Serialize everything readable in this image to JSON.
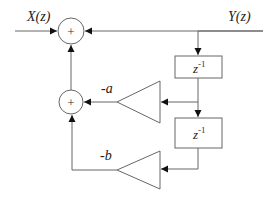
{
  "diagram": {
    "type": "block-diagram",
    "labels": {
      "input": "X(z)",
      "output": "Y(z)",
      "gain_a": "-a",
      "gain_b": "-b",
      "delay_base": "z",
      "delay_exp": "-1",
      "summer_symbol": "+"
    },
    "nodes": [
      {
        "id": "sum1",
        "kind": "summer",
        "symbol": "+"
      },
      {
        "id": "sum2",
        "kind": "summer",
        "symbol": "+"
      },
      {
        "id": "delay1",
        "kind": "delay",
        "label": "z^-1"
      },
      {
        "id": "delay2",
        "kind": "delay",
        "label": "z^-1"
      },
      {
        "id": "gain_a",
        "kind": "gain",
        "label": "-a"
      },
      {
        "id": "gain_b",
        "kind": "gain",
        "label": "-b"
      }
    ],
    "edges": [
      {
        "from": "X(z)",
        "to": "sum1"
      },
      {
        "from": "sum1",
        "to": "Y(z)"
      },
      {
        "from": "Y(z)",
        "to": "delay1"
      },
      {
        "from": "delay1",
        "to": "delay2"
      },
      {
        "from": "delay1",
        "to": "gain_a"
      },
      {
        "from": "delay2",
        "to": "gain_b"
      },
      {
        "from": "gain_a",
        "to": "sum2"
      },
      {
        "from": "gain_b",
        "to": "sum2"
      },
      {
        "from": "sum2",
        "to": "sum1"
      }
    ],
    "colors": {
      "line": "#555555",
      "background": "#ffffff",
      "text": "#222222"
    }
  }
}
